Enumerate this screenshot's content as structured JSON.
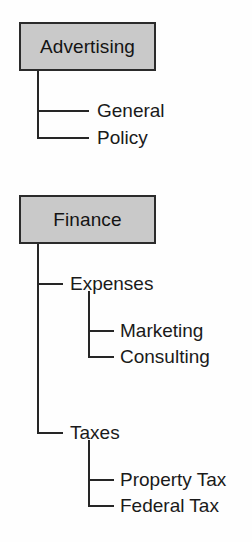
{
  "diagram": {
    "background_color": "#fefefe",
    "box_fill_color": "#c9c9c9",
    "box_border_color": "#2b2b2b",
    "line_color": "#262626",
    "text_color": "#1a1a1a"
  },
  "groups": [
    {
      "root": "Advertising",
      "children": [
        {
          "label": "General",
          "children": []
        },
        {
          "label": "Policy",
          "children": []
        }
      ]
    },
    {
      "root": "Finance",
      "children": [
        {
          "label": "Expenses",
          "children": [
            {
              "label": "Marketing"
            },
            {
              "label": "Consulting"
            }
          ]
        },
        {
          "label": "Taxes",
          "children": [
            {
              "label": "Property Tax"
            },
            {
              "label": "Federal Tax"
            }
          ]
        }
      ]
    }
  ],
  "labels": {
    "advertising": "Advertising",
    "general": "General",
    "policy": "Policy",
    "finance": "Finance",
    "expenses": "Expenses",
    "marketing": "Marketing",
    "consulting": "Consulting",
    "taxes": "Taxes",
    "property_tax": "Property Tax",
    "federal_tax": "Federal Tax"
  }
}
